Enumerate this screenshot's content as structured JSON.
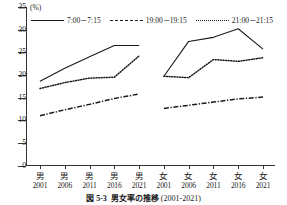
{
  "chart_data": {
    "type": "line",
    "xlabel": "",
    "ylabel": "",
    "unit_label": "(%)",
    "ylim": [
      0,
      35
    ],
    "yticks": [
      0,
      5,
      10,
      15,
      20,
      25,
      30,
      35
    ],
    "grid": false,
    "legend_position": "top",
    "categories": [
      "男\n2001",
      "男\n2006",
      "男\n2011",
      "男\n2016",
      "男\n2021",
      "女\n2001",
      "女\n2006",
      "女\n2011",
      "女\n2016",
      "女\n2021"
    ],
    "tick_groups": [
      {
        "sex": "男",
        "year": "2001"
      },
      {
        "sex": "男",
        "year": "2006"
      },
      {
        "sex": "男",
        "year": "2011"
      },
      {
        "sex": "男",
        "year": "2016"
      },
      {
        "sex": "男",
        "year": "2021"
      },
      {
        "sex": "女",
        "year": "2001"
      },
      {
        "sex": "女",
        "year": "2006"
      },
      {
        "sex": "女",
        "year": "2011"
      },
      {
        "sex": "女",
        "year": "2016"
      },
      {
        "sex": "女",
        "year": "2021"
      }
    ],
    "series": [
      {
        "name": "7:00－7:15",
        "style": "solid",
        "color": "#1a1a1a",
        "values_male": [
          18.6,
          21.5,
          24.0,
          26.5,
          26.5
        ],
        "values_female": [
          19.7,
          27.4,
          28.3,
          30.2,
          25.7
        ]
      },
      {
        "name": "19:00－19:15",
        "style": "dash-dot",
        "color": "#1a1a1a",
        "values_male": [
          11.0,
          12.3,
          13.5,
          14.8,
          15.8
        ],
        "values_female": [
          12.6,
          13.3,
          14.0,
          14.7,
          15.1
        ]
      },
      {
        "name": "21:00－21:15",
        "style": "dotted",
        "color": "#1a1a1a",
        "values_male": [
          17.0,
          18.3,
          19.3,
          19.5,
          24.2
        ],
        "values_female": [
          19.7,
          19.4,
          23.4,
          23.0,
          23.8
        ]
      }
    ]
  },
  "caption": {
    "number": "図 5-3",
    "title": "男女率の推移",
    "years": "(2001-2021)"
  }
}
